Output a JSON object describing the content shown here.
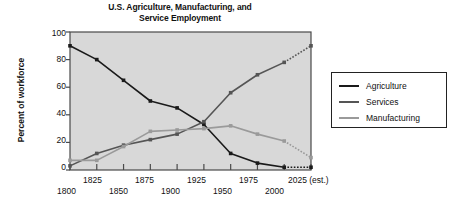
{
  "chart_data": {
    "type": "line",
    "title": "U.S. Agriculture, Manufacturing, and Service Employment",
    "title_line1": "U.S. Agriculture, Manufacturing, and",
    "title_line2": "Service Employment",
    "xlabel": "",
    "ylabel": "Percent of workforce",
    "ylim": [
      0,
      100
    ],
    "yticks": [
      0,
      20,
      40,
      60,
      80,
      100
    ],
    "xlim": [
      1800,
      2025
    ],
    "x": [
      1800,
      1825,
      1850,
      1875,
      1900,
      1925,
      1950,
      1975,
      2000,
      2025
    ],
    "xticklabels": [
      "1800",
      "1825",
      "1850",
      "1875",
      "1900",
      "1925",
      "1950",
      "1975",
      "2000",
      "2025 (est.)"
    ],
    "grid": false,
    "legend_position": "right",
    "forecast_from": 2000,
    "series": [
      {
        "name": "Agriculture",
        "color": "#1a1a1a",
        "values": [
          90,
          80,
          65,
          50,
          45,
          33,
          12,
          5,
          2,
          2
        ]
      },
      {
        "name": "Services",
        "color": "#555555",
        "values": [
          3,
          12,
          18,
          22,
          26,
          35,
          56,
          69,
          78,
          90
        ]
      },
      {
        "name": "Manufacturing",
        "color": "#9a9a9a",
        "values": [
          7,
          7,
          17,
          28,
          29,
          30,
          32,
          26,
          21,
          9
        ]
      }
    ]
  },
  "legend": {
    "entries": [
      {
        "label": "Agriculture",
        "color": "#1a1a1a"
      },
      {
        "label": "Services",
        "color": "#555555"
      },
      {
        "label": "Manufacturing",
        "color": "#9a9a9a"
      }
    ]
  },
  "plot_style": {
    "panel_background": "#d8d8d8",
    "frame_color": "#4a4a4a",
    "page_background": "#ffffff"
  }
}
